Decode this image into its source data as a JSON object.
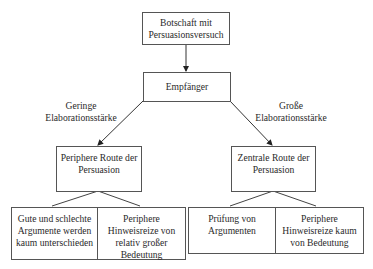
{
  "diagram": {
    "nodes": {
      "message": {
        "lines": [
          "Botschaft mit",
          "Persuasionsversuch"
        ]
      },
      "receiver": {
        "lines": [
          "Empfänger"
        ]
      },
      "peripheral_route": {
        "lines": [
          "Periphere Route der",
          "Persuasion"
        ]
      },
      "central_route": {
        "lines": [
          "Zentrale Route der",
          "Persuasion"
        ]
      },
      "peripheral_args": {
        "lines": [
          "Gute und schlechte",
          "Argumente werden",
          "kaum unterschieden"
        ]
      },
      "peripheral_cues": {
        "lines": [
          "Periphere",
          "Hinweisreize von",
          "relativ großer",
          "Bedeutung"
        ]
      },
      "central_args": {
        "lines": [
          "Prüfung von",
          "Argumenten"
        ]
      },
      "central_cues": {
        "lines": [
          "Periphere",
          "Hinweisreize kaum",
          "von Bedeutung"
        ]
      }
    },
    "edge_labels": {
      "low": {
        "lines": [
          "Geringe",
          "Elaborationsstärke"
        ]
      },
      "high": {
        "lines": [
          "Große",
          "Elaborationsstärke"
        ]
      }
    },
    "colors": {
      "line": "#333333",
      "border": "#555555",
      "text": "#2a2a2a"
    }
  }
}
